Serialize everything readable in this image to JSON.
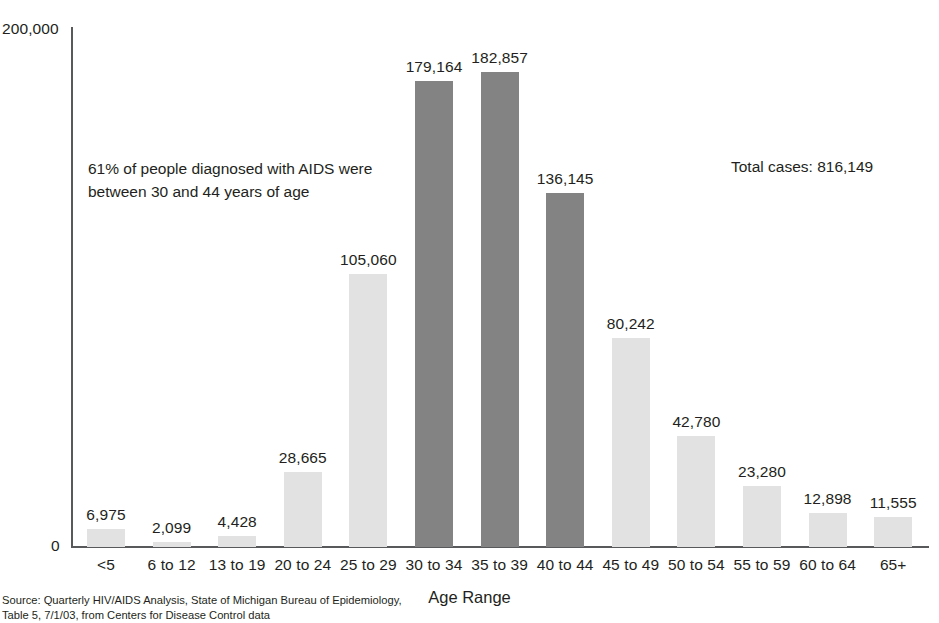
{
  "chart_data": {
    "type": "bar",
    "title": "",
    "xlabel": "Age Range",
    "ylabel": "",
    "ylim": [
      0,
      200000
    ],
    "grid": false,
    "legend": "none",
    "y_ticks": [
      "0",
      "200,000"
    ],
    "categories": [
      "<5",
      "6 to 12",
      "13 to 19",
      "20 to 24",
      "25 to 29",
      "30 to 34",
      "35 to 39",
      "40 to 44",
      "45 to 49",
      "50 to 54",
      "55 to 59",
      "60 to 64",
      "65+"
    ],
    "values": [
      6975,
      2099,
      4428,
      28665,
      105060,
      179164,
      182857,
      136145,
      80242,
      42780,
      23280,
      12898,
      11555
    ],
    "value_labels": [
      "6,975",
      "2,099",
      "4,428",
      "28,665",
      "105,060",
      "179,164",
      "182,857",
      "136,145",
      "80,242",
      "42,780",
      "23,280",
      "12,898",
      "11,555"
    ],
    "highlighted": [
      false,
      false,
      false,
      false,
      false,
      true,
      true,
      true,
      false,
      false,
      false,
      false,
      false
    ],
    "colors": {
      "bar_light": "#e2e2e2",
      "bar_dark": "#838383",
      "axis": "#58595b",
      "text": "#231f20"
    },
    "annotations": [
      "61% of people diagnosed with AIDS were between 30 and 44 years of age",
      "Total cases: 816,149"
    ]
  },
  "annotation": {
    "line1": "61% of people diagnosed with AIDS were",
    "line2": "between 30 and 44 years of age"
  },
  "total_cases": {
    "text": "Total cases: 816,149"
  },
  "axis": {
    "y_top_label": "200,000",
    "y_zero_label": "0",
    "x_title": "Age Range"
  },
  "source": {
    "line1": "Source: Quarterly HIV/AIDS Analysis, State of Michigan Bureau of Epidemiology,",
    "line2": "Table 5, 7/1/03, from Centers for Disease Control data"
  }
}
